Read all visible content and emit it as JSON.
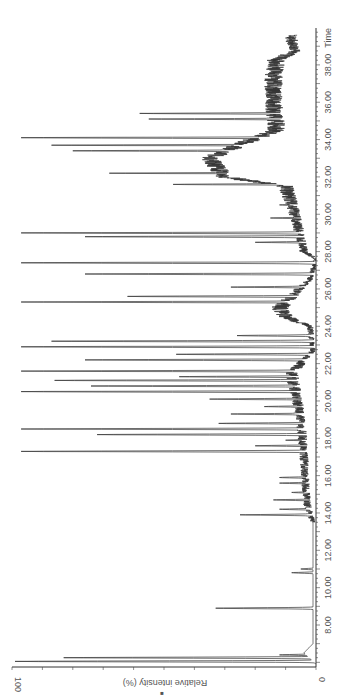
{
  "chart_data": {
    "type": "line",
    "title": "",
    "orientation": "rotated-90-ccw",
    "xlabel": "Time",
    "ylabel": "Relative intensity (%)",
    "xlim": [
      5.8,
      40.2
    ],
    "ylim": [
      0,
      100
    ],
    "x_ticks": [
      "8.00",
      "10.00",
      "12.00",
      "14.00",
      "16.00",
      "18.00",
      "20.00",
      "22.00",
      "24.00",
      "26.00",
      "28.00",
      "30.00",
      "32.00",
      "34.00",
      "36.00",
      "38.00"
    ],
    "y_ticks": [
      "0",
      "100"
    ],
    "grid": false,
    "legend": null,
    "line_color": "#333333",
    "peaks": [
      {
        "t": 6.05,
        "i": 99
      },
      {
        "t": 6.25,
        "i": 83
      },
      {
        "t": 6.4,
        "i": 12
      },
      {
        "t": 8.9,
        "i": 33
      },
      {
        "t": 10.8,
        "i": 8
      },
      {
        "t": 11.0,
        "i": 5
      },
      {
        "t": 13.9,
        "i": 25
      },
      {
        "t": 14.2,
        "i": 12
      },
      {
        "t": 14.7,
        "i": 14
      },
      {
        "t": 15.1,
        "i": 8
      },
      {
        "t": 15.6,
        "i": 12
      },
      {
        "t": 15.9,
        "i": 12
      },
      {
        "t": 16.5,
        "i": 4
      },
      {
        "t": 17.3,
        "i": 97
      },
      {
        "t": 17.6,
        "i": 20
      },
      {
        "t": 17.9,
        "i": 10
      },
      {
        "t": 18.2,
        "i": 72
      },
      {
        "t": 18.5,
        "i": 97
      },
      {
        "t": 18.8,
        "i": 32
      },
      {
        "t": 19.3,
        "i": 28
      },
      {
        "t": 19.7,
        "i": 17
      },
      {
        "t": 20.1,
        "i": 35
      },
      {
        "t": 20.5,
        "i": 97
      },
      {
        "t": 20.8,
        "i": 74
      },
      {
        "t": 21.1,
        "i": 86
      },
      {
        "t": 21.3,
        "i": 45
      },
      {
        "t": 21.6,
        "i": 97
      },
      {
        "t": 22.2,
        "i": 76
      },
      {
        "t": 22.5,
        "i": 46
      },
      {
        "t": 22.9,
        "i": 97
      },
      {
        "t": 23.2,
        "i": 87
      },
      {
        "t": 23.5,
        "i": 26
      },
      {
        "t": 25.3,
        "i": 97
      },
      {
        "t": 25.6,
        "i": 62
      },
      {
        "t": 26.1,
        "i": 28
      },
      {
        "t": 26.8,
        "i": 76
      },
      {
        "t": 27.4,
        "i": 97
      },
      {
        "t": 28.5,
        "i": 20
      },
      {
        "t": 28.8,
        "i": 76
      },
      {
        "t": 29.0,
        "i": 97
      },
      {
        "t": 29.8,
        "i": 15
      },
      {
        "t": 30.5,
        "i": 12
      },
      {
        "t": 31.6,
        "i": 47
      },
      {
        "t": 32.2,
        "i": 68
      },
      {
        "t": 32.8,
        "i": 30
      },
      {
        "t": 33.4,
        "i": 80
      },
      {
        "t": 33.7,
        "i": 87
      },
      {
        "t": 34.1,
        "i": 97
      },
      {
        "t": 34.6,
        "i": 3
      },
      {
        "t": 35.1,
        "i": 55
      },
      {
        "t": 35.4,
        "i": 58
      },
      {
        "t": 35.8,
        "i": 8
      }
    ],
    "baseline": [
      {
        "t": 5.9,
        "i": 0
      },
      {
        "t": 6.5,
        "i": 4
      },
      {
        "t": 7.0,
        "i": 1
      },
      {
        "t": 13.5,
        "i": 1
      },
      {
        "t": 14.5,
        "i": 3
      },
      {
        "t": 17.0,
        "i": 4
      },
      {
        "t": 19.0,
        "i": 5
      },
      {
        "t": 21.5,
        "i": 8
      },
      {
        "t": 22.7,
        "i": 1
      },
      {
        "t": 24.0,
        "i": 2
      },
      {
        "t": 24.5,
        "i": 10
      },
      {
        "t": 25.0,
        "i": 12
      },
      {
        "t": 26.5,
        "i": 2
      },
      {
        "t": 27.6,
        "i": 0
      },
      {
        "t": 28.0,
        "i": 4
      },
      {
        "t": 30.0,
        "i": 7
      },
      {
        "t": 31.5,
        "i": 10
      },
      {
        "t": 32.0,
        "i": 30
      },
      {
        "t": 33.0,
        "i": 35
      },
      {
        "t": 33.8,
        "i": 24
      },
      {
        "t": 34.5,
        "i": 13
      },
      {
        "t": 36.0,
        "i": 14
      },
      {
        "t": 37.5,
        "i": 14
      },
      {
        "t": 38.3,
        "i": 13
      },
      {
        "t": 38.7,
        "i": 7
      },
      {
        "t": 39.3,
        "i": 8
      },
      {
        "t": 39.6,
        "i": 8
      }
    ]
  },
  "axis": {
    "time_label": "Time",
    "intensity_label": "Relative intensity (%)",
    "intensity_min_label": "0",
    "intensity_max_label": "100",
    "marker_glyph": "■"
  }
}
